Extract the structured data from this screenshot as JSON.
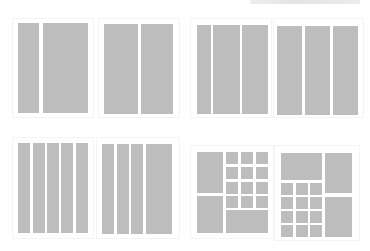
{
  "header": {
    "text": ""
  },
  "colors": {
    "block": "#bdbdbd",
    "background": "#ffffff"
  },
  "layouts": [
    {
      "name": "layout-2-col-narrow-wide",
      "columns": 2,
      "description": "narrow + wide columns"
    },
    {
      "name": "layout-2-col-equal",
      "columns": 2,
      "description": "two equal columns"
    },
    {
      "name": "layout-3-col-narrow-first",
      "columns": 3,
      "description": "narrow + two wide columns"
    },
    {
      "name": "layout-3-col-equal",
      "columns": 3,
      "description": "three equal columns"
    },
    {
      "name": "layout-5-col-equal",
      "columns": 5,
      "description": "five equal columns"
    },
    {
      "name": "layout-4-col-wide-last",
      "columns": 4,
      "description": "three narrow + one wide column"
    },
    {
      "name": "layout-mosaic-left-tall",
      "columns": 0,
      "description": "two tall blocks left, 4x3 grid + wide block right"
    },
    {
      "name": "layout-mosaic-right-tall",
      "columns": 0,
      "description": "wide block + 4x3 grid left, two tall blocks right"
    }
  ]
}
